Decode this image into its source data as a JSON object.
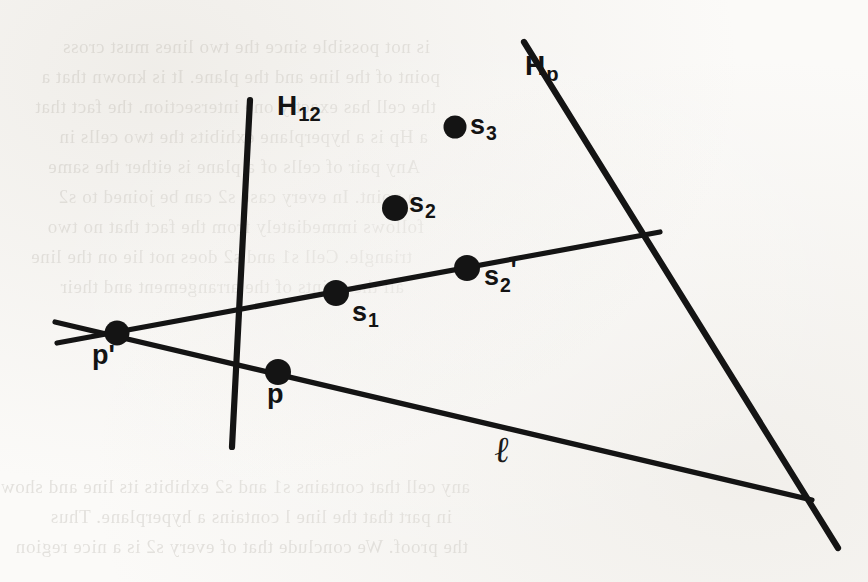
{
  "figure": {
    "ink_color": "#141414",
    "paper_color": "#fbfaf8",
    "width": 868,
    "height": 582,
    "labels": {
      "Hp": "H",
      "Hp_sub": "p",
      "H12": "H",
      "H12_sub": "12",
      "s3": "s",
      "s3_sub": "3",
      "s2": "s",
      "s2_sub": "2",
      "s2prime": "s",
      "s2prime_sub": "2",
      "s2prime_mark": "'",
      "s1": "s",
      "s1_sub": "1",
      "p_prime": "p'",
      "p": "p",
      "ell": "ℓ"
    },
    "points": [
      {
        "name": "s3",
        "x": 455,
        "y": 127,
        "r": 11
      },
      {
        "name": "s2",
        "x": 395,
        "y": 208,
        "r": 13
      },
      {
        "name": "s2prime",
        "x": 467,
        "y": 268,
        "r": 13
      },
      {
        "name": "s1",
        "x": 336,
        "y": 293,
        "r": 13
      },
      {
        "name": "p_prime",
        "x": 117,
        "y": 333,
        "r": 12
      },
      {
        "name": "p",
        "x": 278,
        "y": 372,
        "r": 13
      }
    ],
    "lines": [
      {
        "name": "line-Hp",
        "x1": 524,
        "y1": 42,
        "x2": 838,
        "y2": 548,
        "w": 6
      },
      {
        "name": "line-H12",
        "x1": 250,
        "y1": 100,
        "x2": 232,
        "y2": 447,
        "w": 6
      },
      {
        "name": "line-ell",
        "x1": 55,
        "y1": 322,
        "x2": 812,
        "y2": 500,
        "w": 5
      },
      {
        "name": "line-upper",
        "x1": 57,
        "y1": 343,
        "x2": 660,
        "y2": 232,
        "w": 5
      }
    ]
  },
  "ghost_text": {
    "note": "faint show-through text from the reverse of the scanned page",
    "lines": [
      {
        "x": 40,
        "y": 46,
        "text": "is not possible since the two lines must cross"
      },
      {
        "x": 40,
        "y": 76,
        "text": "point of the line and the plane. It is known that a"
      },
      {
        "x": 40,
        "y": 106,
        "text": "the cell has exactly one intersection. the fact that"
      },
      {
        "x": 40,
        "y": 136,
        "text": "a Hp is a hyperplane exhibits the two cells in"
      },
      {
        "x": 40,
        "y": 166,
        "text": "Any pair of cells of a plane is either the same"
      },
      {
        "x": 40,
        "y": 196,
        "text": "a point. In every case s2 can be joined to s2"
      },
      {
        "x": 40,
        "y": 226,
        "text": "follows immediately from the fact that no two"
      },
      {
        "x": 40,
        "y": 256,
        "text": "triangle. Cell s1 and s2 does not lie on the line"
      },
      {
        "x": 40,
        "y": 286,
        "text": "all the points of the arrangement and their"
      },
      {
        "x": 40,
        "y": 486,
        "text": "any cell that contains s1 and s2 exhibits its line and shows"
      },
      {
        "x": 40,
        "y": 516,
        "text": "in part that the line l contains a hyperplane. Thus"
      },
      {
        "x": 40,
        "y": 546,
        "text": "the proof. We conclude that of every s2 is a nice region"
      }
    ]
  }
}
